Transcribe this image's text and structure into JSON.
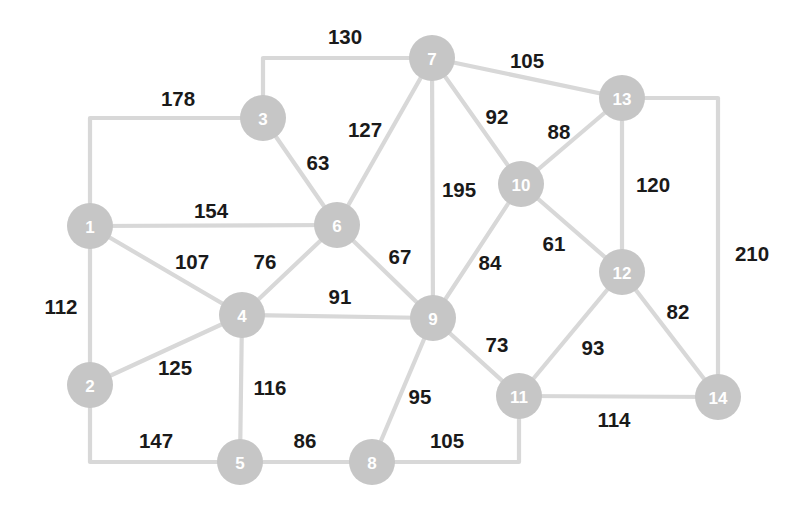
{
  "diagram": {
    "type": "weighted-undirected-graph",
    "title": "",
    "background_color": "#ffffff",
    "node_fill_color": "#c6c6c6",
    "node_label_color": "#ffffff",
    "edge_color": "#d8d8d8",
    "weight_label_color": "#1a1a1a",
    "node_radius": 23,
    "nodes": [
      {
        "id": "1",
        "label": "1",
        "x": 90,
        "y": 226
      },
      {
        "id": "2",
        "label": "2",
        "x": 90,
        "y": 385
      },
      {
        "id": "3",
        "label": "3",
        "x": 263,
        "y": 118
      },
      {
        "id": "4",
        "label": "4",
        "x": 242,
        "y": 315
      },
      {
        "id": "5",
        "label": "5",
        "x": 240,
        "y": 462
      },
      {
        "id": "6",
        "label": "6",
        "x": 337,
        "y": 225
      },
      {
        "id": "7",
        "label": "7",
        "x": 432,
        "y": 58
      },
      {
        "id": "8",
        "label": "8",
        "x": 372,
        "y": 462
      },
      {
        "id": "9",
        "label": "9",
        "x": 433,
        "y": 318
      },
      {
        "id": "10",
        "label": "10",
        "x": 521,
        "y": 184
      },
      {
        "id": "11",
        "label": "11",
        "x": 519,
        "y": 396
      },
      {
        "id": "12",
        "label": "12",
        "x": 622,
        "y": 272
      },
      {
        "id": "13",
        "label": "13",
        "x": 622,
        "y": 98
      },
      {
        "id": "14",
        "label": "14",
        "x": 718,
        "y": 397
      }
    ],
    "edges": [
      {
        "from": "3",
        "to": "7",
        "weight": "130",
        "path": "263,118 263,58 432,58",
        "label_x": 345,
        "label_y": 36
      },
      {
        "from": "7",
        "to": "13",
        "weight": "105",
        "path": "432,58 622,98",
        "label_x": 527,
        "label_y": 60
      },
      {
        "from": "1",
        "to": "3",
        "weight": "178",
        "path": "90,226 90,118 263,118",
        "label_x": 178,
        "label_y": 98
      },
      {
        "from": "3",
        "to": "6",
        "weight": "63",
        "path": "263,118 337,225",
        "label_x": 318,
        "label_y": 162
      },
      {
        "from": "6",
        "to": "7",
        "weight": "127",
        "path": "337,225 432,58",
        "label_x": 365,
        "label_y": 129
      },
      {
        "from": "7",
        "to": "10",
        "weight": "92",
        "path": "432,58 521,184",
        "label_x": 497,
        "label_y": 116
      },
      {
        "from": "10",
        "to": "13",
        "weight": "88",
        "path": "521,184 622,98",
        "label_x": 559,
        "label_y": 131
      },
      {
        "from": "13",
        "to": "12",
        "weight": "120",
        "path": "622,98 622,272",
        "label_x": 653,
        "label_y": 184
      },
      {
        "from": "13",
        "to": "14",
        "weight": "210",
        "path": "622,98 718,98 718,397",
        "label_x": 752,
        "label_y": 253
      },
      {
        "from": "1",
        "to": "6",
        "weight": "154",
        "path": "90,226 337,225",
        "label_x": 211,
        "label_y": 210
      },
      {
        "from": "7",
        "to": "9",
        "weight": "195",
        "path": "432,58 433,318",
        "label_x": 459,
        "label_y": 189
      },
      {
        "from": "1",
        "to": "4",
        "weight": "107",
        "path": "90,226 242,315",
        "label_x": 192,
        "label_y": 261
      },
      {
        "from": "4",
        "to": "6",
        "weight": "76",
        "path": "242,315 337,225",
        "label_x": 265,
        "label_y": 261
      },
      {
        "from": "6",
        "to": "9",
        "weight": "67",
        "path": "337,225 433,318",
        "label_x": 400,
        "label_y": 256
      },
      {
        "from": "9",
        "to": "10",
        "weight": "84",
        "path": "433,318 521,184",
        "label_x": 490,
        "label_y": 262
      },
      {
        "from": "10",
        "to": "12",
        "weight": "61",
        "path": "521,184 622,272",
        "label_x": 554,
        "label_y": 243
      },
      {
        "from": "1",
        "to": "2",
        "weight": "112",
        "path": "90,226 90,385",
        "label_x": 61,
        "label_y": 306
      },
      {
        "from": "4",
        "to": "9",
        "weight": "91",
        "path": "242,315 433,318",
        "label_x": 340,
        "label_y": 296
      },
      {
        "from": "2",
        "to": "4",
        "weight": "125",
        "path": "90,385 242,315",
        "label_x": 175,
        "label_y": 367
      },
      {
        "from": "4",
        "to": "5",
        "weight": "116",
        "path": "242,315 240,462",
        "label_x": 270,
        "label_y": 387
      },
      {
        "from": "9",
        "to": "11",
        "weight": "73",
        "path": "433,318 519,396",
        "label_x": 497,
        "label_y": 344
      },
      {
        "from": "11",
        "to": "12",
        "weight": "93",
        "path": "519,396 622,272",
        "label_x": 593,
        "label_y": 347
      },
      {
        "from": "12",
        "to": "14",
        "weight": "82",
        "path": "622,272 718,397",
        "label_x": 678,
        "label_y": 311
      },
      {
        "from": "9",
        "to": "8",
        "weight": "95",
        "path": "433,318 372,462",
        "label_x": 420,
        "label_y": 396
      },
      {
        "from": "11",
        "to": "14",
        "weight": "114",
        "path": "519,396 718,397",
        "label_x": 614,
        "label_y": 419
      },
      {
        "from": "2",
        "to": "5",
        "weight": "147",
        "path": "90,385 90,462 240,462",
        "label_x": 156,
        "label_y": 440
      },
      {
        "from": "5",
        "to": "8",
        "weight": "86",
        "path": "240,462 372,462",
        "label_x": 305,
        "label_y": 440
      },
      {
        "from": "8",
        "to": "11",
        "weight": "105",
        "path": "372,462 519,462 519,396",
        "label_x": 447,
        "label_y": 440
      }
    ]
  }
}
